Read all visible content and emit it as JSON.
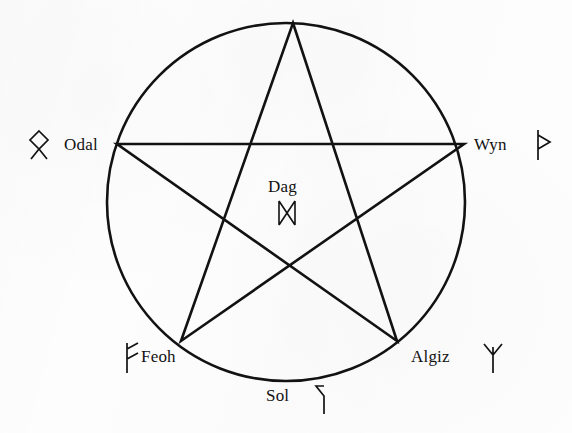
{
  "figure": {
    "type": "pentagram-diagram",
    "title": "",
    "background_color": "#fdfdfd",
    "ink_color": "#121212",
    "circle": {
      "center_x": 286,
      "center_y": 202,
      "radius": 179,
      "stroke_width": 2.6
    },
    "pentagram": {
      "stroke_width": 2.6,
      "vertices": [
        {
          "name": "top",
          "x": 293,
          "y": 23
        },
        {
          "name": "right",
          "x": 464,
          "y": 144
        },
        {
          "name": "bottom-right",
          "x": 397,
          "y": 341
        },
        {
          "name": "bottom-left",
          "x": 181,
          "y": 341
        },
        {
          "name": "left",
          "x": 117,
          "y": 144
        }
      ]
    }
  },
  "labels": {
    "odal": {
      "text": "Odal",
      "rune": "ᛟ",
      "rune_name": "odal-rune",
      "rune_x": 26,
      "rune_y": 128,
      "rune_size": 22
    },
    "wyn": {
      "text": "Wyn",
      "rune": "ᚦ",
      "rune_name": "wyn-rune",
      "rune_x": 532,
      "rune_y": 128,
      "rune_size": 22
    },
    "feoh": {
      "text": "Feoh",
      "rune": "ᚠ",
      "rune_name": "feoh-rune",
      "rune_x": 121,
      "rune_y": 341,
      "rune_size": 22
    },
    "algiz": {
      "text": "Algiz",
      "rune": "ᛉ",
      "rune_name": "algiz-rune",
      "rune_x": 481,
      "rune_y": 341,
      "rune_size": 22
    },
    "sol": {
      "text": "Sol",
      "rune": "ᛌ",
      "rune_name": "sol-rune",
      "rune_x": 311,
      "rune_y": 382,
      "rune_size": 22
    },
    "dag": {
      "text": "Dag",
      "rune": "ᛞ",
      "rune_name": "dag-rune",
      "rune_x": 275,
      "rune_y": 198,
      "rune_size": 22
    }
  }
}
